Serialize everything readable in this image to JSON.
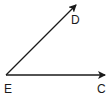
{
  "diagram": {
    "type": "angle",
    "vertex": {
      "label": "E",
      "x": 6,
      "y": 75
    },
    "rays": [
      {
        "name": "ray-ED",
        "label": "D",
        "from": [
          6,
          75
        ],
        "to": [
          77,
          4
        ]
      },
      {
        "name": "ray-EC",
        "label": "C",
        "from": [
          6,
          75
        ],
        "to": [
          106,
          75
        ]
      }
    ],
    "labels": {
      "D": "D",
      "E": "E",
      "C": "C"
    },
    "stroke_color": "#1a1a1a"
  }
}
